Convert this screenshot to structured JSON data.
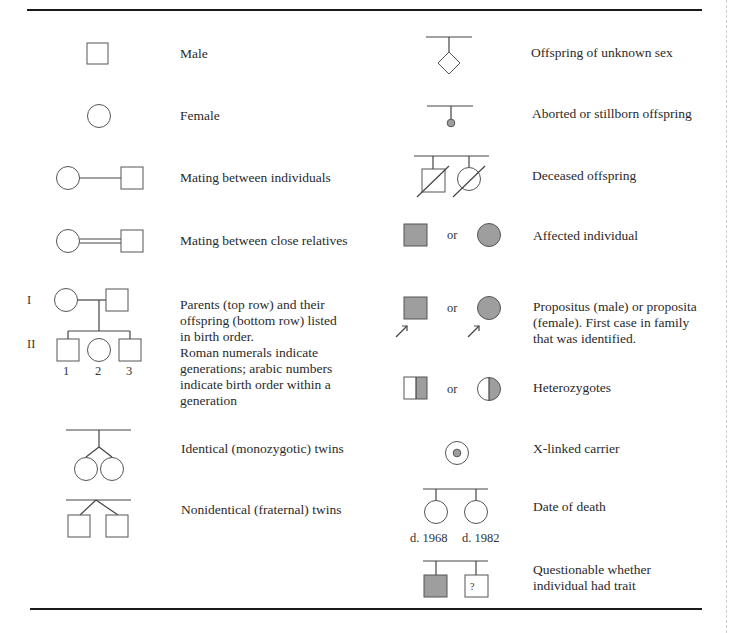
{
  "figure": {
    "colors": {
      "affected_fill": "#9e9e9e",
      "line": "#444444",
      "rule": "#1a1a1a"
    },
    "left_column": [
      {
        "id": "male",
        "symbol": "square-icon",
        "label": "Male"
      },
      {
        "id": "female",
        "symbol": "circle-icon",
        "label": "Female"
      },
      {
        "id": "mating",
        "symbol": "mating-line-icon",
        "label": "Mating between individuals"
      },
      {
        "id": "consanguineous",
        "symbol": "double-mating-line-icon",
        "label": "Mating between close relatives"
      },
      {
        "id": "parents-offspring",
        "symbol": "pedigree-family-icon",
        "label_lines": [
          "Parents (top row) and their",
          "offspring (bottom row) listed",
          "in birth order.",
          "Roman numerals indicate",
          "generations; arabic numbers",
          "indicate birth order within a",
          "generation"
        ],
        "generation_labels": [
          "I",
          "II"
        ],
        "birth_order_labels": [
          "1",
          "2",
          "3"
        ]
      },
      {
        "id": "identical-twins",
        "symbol": "monozygotic-twins-icon",
        "label": "Identical (monozygotic) twins"
      },
      {
        "id": "fraternal-twins",
        "symbol": "dizygotic-twins-icon",
        "label": "Nonidentical (fraternal) twins"
      }
    ],
    "right_column": [
      {
        "id": "unknown-sex",
        "symbol": "diamond-icon",
        "label": "Offspring of unknown sex"
      },
      {
        "id": "aborted",
        "symbol": "small-dot-icon",
        "label": "Aborted or stillborn offspring"
      },
      {
        "id": "deceased",
        "symbol": "slashed-symbols-icon",
        "label": "Deceased offspring"
      },
      {
        "id": "affected",
        "symbol": "filled-symbols-icon",
        "or": "or",
        "label": "Affected individual"
      },
      {
        "id": "propositus",
        "symbol": "arrowed-symbols-icon",
        "or": "or",
        "label_lines": [
          "Propositus (male) or proposita",
          "(female). First case in family",
          "that was identified."
        ]
      },
      {
        "id": "heterozygotes",
        "symbol": "half-filled-symbols-icon",
        "or": "or",
        "label": "Heterozygotes"
      },
      {
        "id": "x-linked-carrier",
        "symbol": "dotted-circle-icon",
        "label": "X-linked carrier"
      },
      {
        "id": "date-of-death",
        "symbol": "dated-circles-icon",
        "label": "Date of death",
        "dates": [
          "d. 1968",
          "d. 1982"
        ]
      },
      {
        "id": "questionable",
        "symbol": "question-square-icon",
        "label_lines": [
          "Questionable whether",
          "individual had trait"
        ],
        "question_mark": "?"
      }
    ]
  }
}
